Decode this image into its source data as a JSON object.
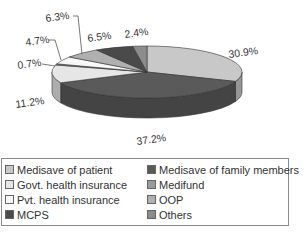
{
  "chart_data": {
    "type": "pie",
    "style": "3d-exploded-none",
    "title": "",
    "legend_position": "bottom",
    "slices": [
      {
        "name": "Medisave of patient",
        "value": 30.9,
        "label": "30.9%",
        "color": "#c8c8c8"
      },
      {
        "name": "Medisave of family members",
        "value": 37.2,
        "label": "37.2%",
        "color": "#5a5a5a"
      },
      {
        "name": "Govt. health insurance",
        "value": 11.2,
        "label": "11.2%",
        "color": "#e6e6e6"
      },
      {
        "name": "Medifund",
        "value": 0.7,
        "label": "0.7%",
        "color": "#9a9a9a"
      },
      {
        "name": "Pvt. health insurance",
        "value": 4.7,
        "label": "4.7%",
        "color": "#f7f7f7"
      },
      {
        "name": "OOP",
        "value": 6.3,
        "label": "6.3%",
        "color": "#b0b0b0"
      },
      {
        "name": "MCPS",
        "value": 6.5,
        "label": "6.5%",
        "color": "#4a4a4a"
      },
      {
        "name": "Others",
        "value": 2.4,
        "label": "2.4%",
        "color": "#8c8c8c"
      }
    ]
  },
  "legend": {
    "items": [
      {
        "label": "Medisave of patient",
        "color": "#c8c8c8"
      },
      {
        "label": "Govt. health insurance",
        "color": "#e6e6e6"
      },
      {
        "label": "Pvt. health insurance",
        "color": "#f7f7f7"
      },
      {
        "label": "MCPS",
        "color": "#4a4a4a"
      },
      {
        "label": "Medisave of family members",
        "color": "#5a5a5a"
      },
      {
        "label": "Medifund",
        "color": "#9a9a9a"
      },
      {
        "label": "OOP",
        "color": "#b0b0b0"
      },
      {
        "label": "Others",
        "color": "#8c8c8c"
      }
    ]
  },
  "labels": {
    "l0": "30.9%",
    "l1": "37.2%",
    "l2": "11.2%",
    "l3": "0.7%",
    "l4": "4.7%",
    "l5": "6.3%",
    "l6": "6.5%",
    "l7": "2.4%"
  }
}
